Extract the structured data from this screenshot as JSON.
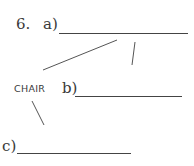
{
  "question": {
    "number": "6.",
    "center_word": "CHAIR",
    "blanks": [
      {
        "label": "a)",
        "value": ""
      },
      {
        "label": "b)",
        "value": ""
      },
      {
        "label": "c)",
        "value": ""
      }
    ]
  }
}
